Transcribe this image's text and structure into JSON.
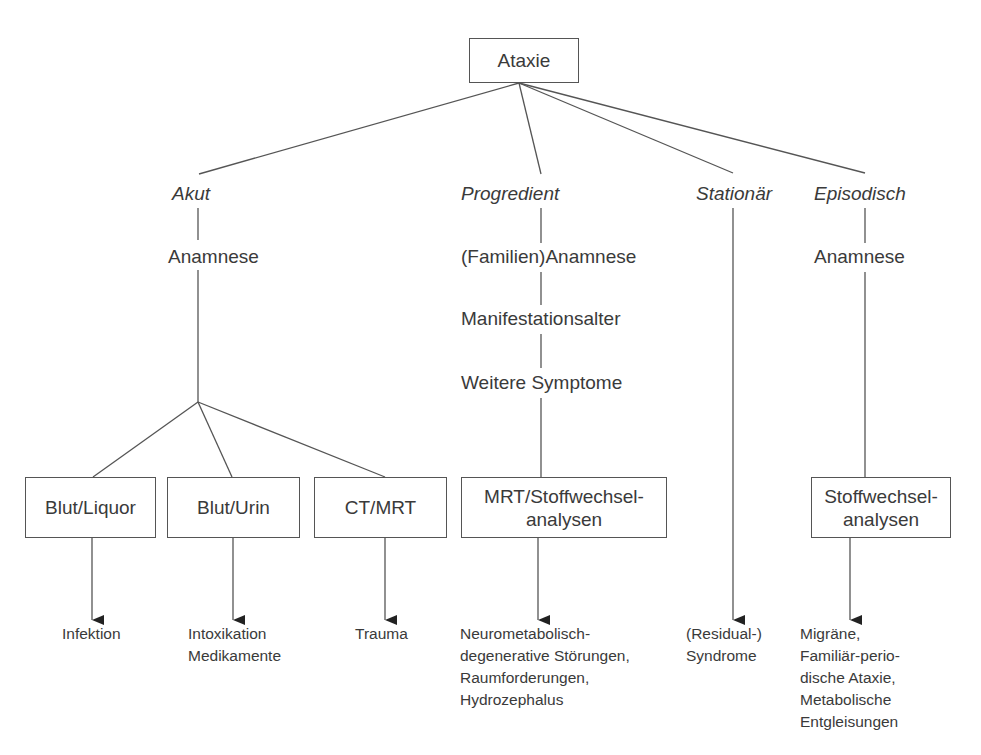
{
  "diagram": {
    "root": {
      "label": "Ataxie"
    },
    "branches": [
      {
        "category": "Akut",
        "steps": [
          "Anamnese"
        ],
        "tests": [
          {
            "label": "Blut/Liquor",
            "result": "Infektion"
          },
          {
            "label": "Blut/Urin",
            "result": "Intoxikation\nMedikamente"
          },
          {
            "label": "CT/MRT",
            "result": "Trauma"
          }
        ]
      },
      {
        "category": "Progredient",
        "steps": [
          "(Familien)Anamnese",
          "Manifestationsalter",
          "Weitere Symptome"
        ],
        "tests": [
          {
            "label": "MRT/Stoffwechsel-\nanalysen",
            "result": "Neurometabolisch-\ndegenerative Störungen,\nRaumforderungen,\nHydrozephalus"
          }
        ]
      },
      {
        "category": "Stationär",
        "steps": [],
        "tests": [],
        "result": "(Residual-)\nSyndrome"
      },
      {
        "category": "Episodisch",
        "steps": [
          "Anamnese"
        ],
        "tests": [
          {
            "label": "Stoffwechsel-\nanalysen",
            "result": "Migräne,\nFamiliär-perio-\ndische Ataxie,\nMetabolische\nEntgleisungen"
          }
        ]
      }
    ]
  },
  "colors": {
    "line": "#555555",
    "text": "#3a3a3a",
    "arrow": "#222222",
    "background": "#ffffff"
  }
}
